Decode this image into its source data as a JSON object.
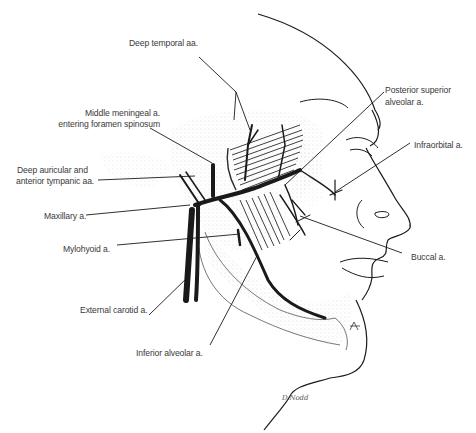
{
  "figure": {
    "colors": {
      "ink": "#1a1a1a",
      "label": "#3a3a3a",
      "stipple": "#9a9a9a",
      "background": "#ffffff"
    }
  },
  "labels": {
    "deep_temporal": "Deep temporal aa.",
    "middle_meningeal_1": "Middle meningeal a.",
    "middle_meningeal_2": "entering foramen spinosum",
    "deep_auricular_1": "Deep auricular and",
    "deep_auricular_2": "anterior tympanic aa.",
    "maxillary": "Maxillary a.",
    "mylohyoid": "Mylohyoid a.",
    "external_carotid": "External carotid a.",
    "inferior_alveolar": "Inferior alveolar a.",
    "posterior_superior_1": "Posterior superior",
    "posterior_superior_2": "alveolar a.",
    "infraorbital": "Infraorbital a.",
    "buccal": "Buccal a.",
    "signature": "D.Nodd"
  }
}
